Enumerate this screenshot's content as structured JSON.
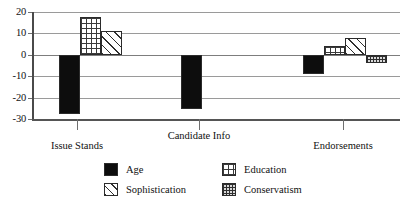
{
  "chart_data": {
    "type": "bar",
    "title": "",
    "subtitle": "",
    "xlabel": "",
    "ylabel": "",
    "categories": [
      "Issue Stands",
      "Candidate Info",
      "Endorsements"
    ],
    "ylim": [
      -30,
      20
    ],
    "yticks": [
      20,
      10,
      0,
      -10,
      -20,
      -30
    ],
    "ytick_labels": [
      "20",
      "10",
      "0",
      "-10",
      "-20",
      "-30"
    ],
    "grid": true,
    "legend_position": "bottom",
    "zero_line": 0,
    "series": [
      {
        "name": "Age",
        "pattern": "solid",
        "swatch": "fill-solid",
        "values": [
          -27.5,
          -25.5,
          -9
        ]
      },
      {
        "name": "Education",
        "pattern": "grid",
        "swatch": "fill-grid",
        "values": [
          17.5,
          null,
          4
        ]
      },
      {
        "name": "Sophistication",
        "pattern": "diagonal-hatch",
        "swatch": "fill-hatch",
        "values": [
          11,
          null,
          8
        ]
      },
      {
        "name": "Conservatism",
        "pattern": "dots",
        "swatch": "fill-dots",
        "values": [
          null,
          null,
          -4
        ]
      }
    ]
  },
  "legend": {
    "entries": [
      {
        "label": "Age",
        "swatch": "fill-solid"
      },
      {
        "label": "Education",
        "swatch": "fill-grid"
      },
      {
        "label": "Sophistication",
        "swatch": "fill-hatch"
      },
      {
        "label": "Conservatism",
        "swatch": "fill-dots"
      }
    ]
  },
  "axis": {
    "y_tick_labels": [
      "20",
      "10",
      "0",
      "-10",
      "-20",
      "-30"
    ],
    "x_tick_labels": [
      "Issue Stands",
      "Candidate Info",
      "Endorsements"
    ]
  },
  "colors": {
    "background": "#ffffff",
    "gridline": "#9a9a9a",
    "axis": "#4a4a4a",
    "bar_outline": "#2b2b2b",
    "age_fill": "#0d0d0d",
    "text": "#111111"
  }
}
